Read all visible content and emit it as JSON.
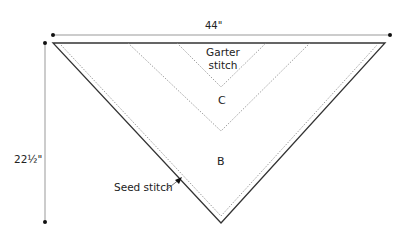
{
  "diagram": {
    "type": "knitting-schematic",
    "shape": "triangular shawl",
    "dimensions": {
      "width": "44\"",
      "height": "22½\""
    },
    "sections": {
      "garter": "Garter\nstitch",
      "garter_line1": "Garter",
      "garter_line2": "stitch",
      "c": "C",
      "b": "B",
      "seed": "Seed stitch"
    },
    "colors": {
      "outline": "#333333",
      "dotted": "#888888",
      "dimension_line": "#999999"
    }
  }
}
